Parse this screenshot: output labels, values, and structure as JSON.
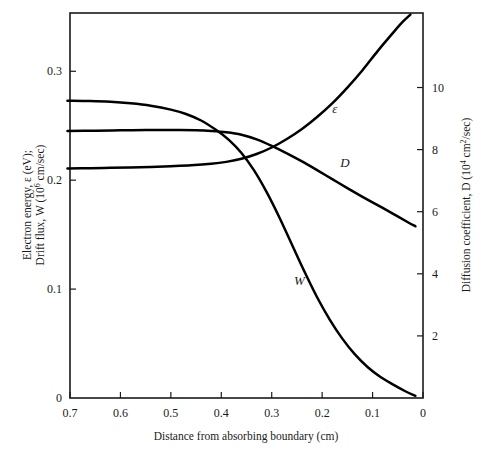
{
  "chart_data": {
    "type": "line",
    "title": "",
    "xlabel": "Distance from absorbing boundary (cm)",
    "ylabel_left_line1": "Electron energy, ε (eV);",
    "ylabel_left_line2_a": "Drift flux, W (10",
    "ylabel_left_line2_sup": "6",
    "ylabel_left_line2_b": " cm/sec)",
    "ylabel_right_a": "Diffusion coefficient, D (10",
    "ylabel_right_sup": "4",
    "ylabel_right_b": " cm",
    "ylabel_right_sup2": "2",
    "ylabel_right_c": "/sec)",
    "x_reversed": true,
    "xlim": [
      0.7,
      0.0
    ],
    "xticks": [
      0.7,
      0.6,
      0.5,
      0.4,
      0.3,
      0.2,
      0.1,
      0.0
    ],
    "xticklabels": [
      "0.7",
      "0.6",
      "0.5",
      "0.4",
      "0.3",
      "0.2",
      "0.1",
      "0"
    ],
    "ylim_left": [
      0.0,
      0.3535
    ],
    "yticks_left": [
      0.0,
      0.1,
      0.2,
      0.3
    ],
    "yticklabels_left": [
      "0",
      "0.1",
      "0.2",
      "0.3"
    ],
    "ylim_right": [
      0.0,
      12.4
    ],
    "yticks_right": [
      2,
      4,
      6,
      8,
      10
    ],
    "yticklabels_right": [
      "2",
      "4",
      "6",
      "8",
      "10"
    ],
    "grid": false,
    "legend": "inline-curve-labels",
    "series": [
      {
        "name": "e",
        "label": "ε",
        "axis": "left",
        "label_x": 0.175,
        "label_y": 0.262,
        "x": [
          0.705,
          0.66,
          0.62,
          0.58,
          0.54,
          0.5,
          0.46,
          0.42,
          0.39,
          0.36,
          0.33,
          0.3,
          0.27,
          0.24,
          0.21,
          0.18,
          0.15,
          0.12,
          0.09,
          0.06,
          0.04,
          0.025
        ],
        "y": [
          0.2107,
          0.211,
          0.2113,
          0.2117,
          0.2122,
          0.2128,
          0.2136,
          0.215,
          0.2168,
          0.2196,
          0.224,
          0.23,
          0.2378,
          0.247,
          0.258,
          0.2705,
          0.285,
          0.301,
          0.3185,
          0.335,
          0.3455,
          0.352
        ]
      },
      {
        "name": "D",
        "label": "D",
        "axis": "right",
        "label_x": 0.155,
        "label_y": 7.45,
        "x": [
          0.705,
          0.65,
          0.6,
          0.55,
          0.5,
          0.45,
          0.42,
          0.39,
          0.36,
          0.33,
          0.3,
          0.27,
          0.24,
          0.21,
          0.18,
          0.15,
          0.12,
          0.09,
          0.06,
          0.03,
          0.015
        ],
        "y": [
          8.6,
          8.61,
          8.62,
          8.63,
          8.63,
          8.62,
          8.6,
          8.56,
          8.48,
          8.33,
          8.12,
          7.88,
          7.62,
          7.34,
          7.05,
          6.76,
          6.48,
          6.21,
          5.94,
          5.66,
          5.53
        ]
      },
      {
        "name": "W",
        "label": "W",
        "axis": "left",
        "label_x": 0.245,
        "label_y": 0.1035,
        "x": [
          0.705,
          0.66,
          0.62,
          0.58,
          0.54,
          0.5,
          0.47,
          0.44,
          0.41,
          0.385,
          0.36,
          0.335,
          0.31,
          0.285,
          0.26,
          0.235,
          0.21,
          0.185,
          0.16,
          0.135,
          0.11,
          0.085,
          0.06,
          0.035,
          0.015
        ],
        "y": [
          0.273,
          0.2727,
          0.272,
          0.2706,
          0.2684,
          0.2648,
          0.2608,
          0.2548,
          0.246,
          0.237,
          0.225,
          0.209,
          0.189,
          0.166,
          0.141,
          0.116,
          0.0925,
          0.072,
          0.0545,
          0.04,
          0.0285,
          0.0195,
          0.0125,
          0.0062,
          0.002
        ]
      }
    ]
  },
  "curve_labels": {
    "e": "ε",
    "D": "D",
    "W": "W"
  }
}
